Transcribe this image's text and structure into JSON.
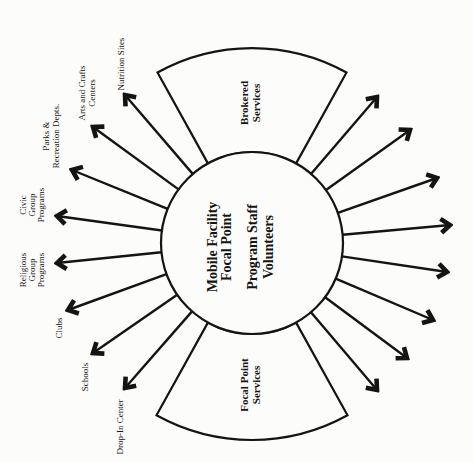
{
  "diagram": {
    "center": {
      "lines": [
        "Mobile Facility",
        "Focal Point",
        "Program Staff",
        "Volunteers"
      ]
    },
    "wedges": [
      {
        "lines": [
          "Brokered",
          "Services"
        ]
      },
      {
        "lines": [
          "Focal Point",
          "Services"
        ]
      }
    ],
    "left_labels": [
      {
        "lines": [
          "Nutrition Sites"
        ]
      },
      {
        "lines": [
          "Arts and Crafts",
          "Centers"
        ]
      },
      {
        "lines": [
          "Parks &",
          "Recreation Depts."
        ]
      },
      {
        "lines": [
          "Civic",
          "Group",
          "Programs"
        ]
      },
      {
        "lines": [
          "Religious",
          "Group",
          "Programs"
        ]
      },
      {
        "lines": [
          "Clubs"
        ]
      },
      {
        "lines": [
          "Schools"
        ]
      },
      {
        "lines": [
          "Drop-In Center"
        ]
      }
    ],
    "right_arrow_count": 8,
    "colors": {
      "ink": "#141414",
      "paper": "#fcfcfa"
    }
  }
}
